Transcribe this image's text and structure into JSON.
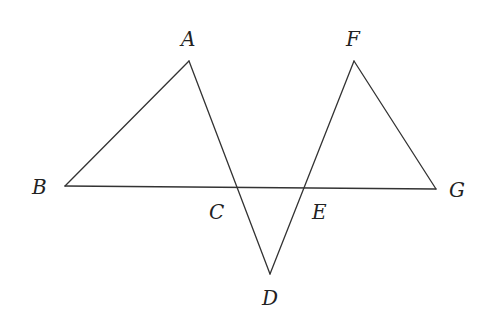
{
  "diagram": {
    "type": "geometry",
    "line_color": "#333333",
    "label_color": "#222222",
    "points": {
      "A": {
        "label": "A",
        "x": 189,
        "y": 61,
        "lx": 181,
        "ly": 46
      },
      "B": {
        "label": "B",
        "x": 65,
        "y": 186,
        "lx": 32,
        "ly": 194
      },
      "C": {
        "label": "C",
        "x": 237,
        "y": 188,
        "lx": 209,
        "ly": 219
      },
      "D": {
        "label": "D",
        "x": 270,
        "y": 274,
        "lx": 262,
        "ly": 305
      },
      "E": {
        "label": "E",
        "x": 304,
        "y": 188,
        "lx": 312,
        "ly": 219
      },
      "F": {
        "label": "F",
        "x": 354,
        "y": 61,
        "lx": 346,
        "ly": 46
      },
      "G": {
        "label": "G",
        "x": 436,
        "y": 189,
        "lx": 449,
        "ly": 197
      }
    },
    "segments": [
      {
        "from": "A",
        "to": "B"
      },
      {
        "from": "B",
        "to": "G"
      },
      {
        "from": "A",
        "to": "D"
      },
      {
        "from": "D",
        "to": "F"
      },
      {
        "from": "F",
        "to": "G"
      }
    ]
  }
}
